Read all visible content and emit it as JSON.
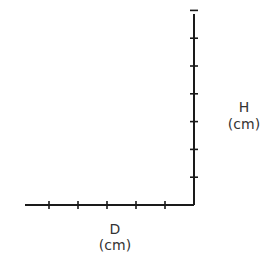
{
  "chart_data": {
    "type": "line",
    "title": "",
    "xlabel": "D",
    "xlabel_unit": "(cm)",
    "ylabel": "H",
    "ylabel_unit": "(cm)",
    "x_tick_count": 5,
    "y_tick_count": 7,
    "x_tick_labels": [],
    "y_tick_labels": [],
    "series": [],
    "grid": false,
    "y_axis_side": "right",
    "x_axis_direction": "leftward"
  }
}
